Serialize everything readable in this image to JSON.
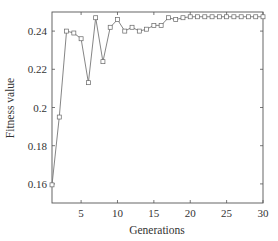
{
  "chart_data": {
    "type": "line",
    "title": "",
    "xlabel": "Generations",
    "ylabel": "Fitness value",
    "xlim": [
      1,
      30
    ],
    "ylim": [
      0.15,
      0.25
    ],
    "grid": false,
    "legend": null,
    "marker": "square",
    "x_ticks": [
      5,
      10,
      15,
      20,
      25,
      30
    ],
    "x_tick_labels": [
      "5",
      "10",
      "15",
      "20",
      "25",
      "30"
    ],
    "y_ticks": [
      0.16,
      0.18,
      0.2,
      0.22,
      0.24
    ],
    "y_tick_labels": [
      "0.16",
      "0.18",
      "0.2",
      "0.22",
      "0.24"
    ],
    "x": [
      1,
      2,
      3,
      4,
      5,
      6,
      7,
      8,
      9,
      10,
      11,
      12,
      13,
      14,
      15,
      16,
      17,
      18,
      19,
      20,
      21,
      22,
      23,
      24,
      25,
      26,
      27,
      28,
      29,
      30
    ],
    "series": [
      {
        "name": "Fitness value",
        "color": "#555555",
        "values": [
          0.1595,
          0.195,
          0.24,
          0.239,
          0.236,
          0.213,
          0.247,
          0.224,
          0.242,
          0.246,
          0.24,
          0.242,
          0.24,
          0.241,
          0.243,
          0.243,
          0.247,
          0.246,
          0.247,
          0.2475,
          0.2475,
          0.2475,
          0.2475,
          0.2475,
          0.2475,
          0.2475,
          0.2475,
          0.2475,
          0.2475,
          0.2475
        ]
      }
    ]
  },
  "colors": {
    "axis": "#555555",
    "line": "#777777",
    "marker_edge": "#666666",
    "text": "#333333"
  }
}
